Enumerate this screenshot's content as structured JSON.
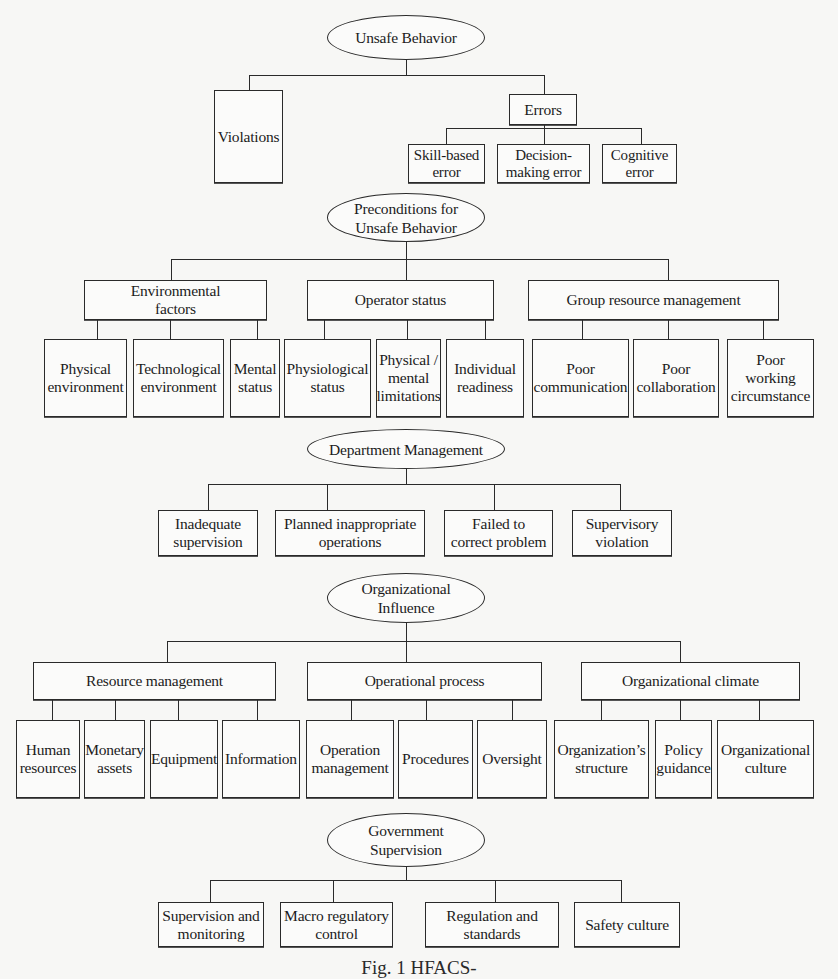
{
  "diagram": {
    "levels": [
      {
        "id": "unsafe-behavior",
        "title": "Unsafe Behavior",
        "children": [
          {
            "label": "Violations"
          },
          {
            "label": "Errors",
            "children": [
              {
                "label": "Skill-based\nerror"
              },
              {
                "label": "Decision-\nmaking error"
              },
              {
                "label": "Cognitive\nerror"
              }
            ]
          }
        ]
      },
      {
        "id": "preconditions",
        "title": "Preconditions for\nUnsafe Behavior",
        "children": [
          {
            "label": "Environmental\nfactors",
            "children": [
              {
                "label": "Physical\nenvironment"
              },
              {
                "label": "Technological\nenvironment"
              },
              {
                "label": "Mental\nstatus"
              }
            ]
          },
          {
            "label": "Operator status",
            "children": [
              {
                "label": "Physiological\nstatus"
              },
              {
                "label": "Physical /\nmental\nlimitations"
              },
              {
                "label": "Individual\nreadiness"
              }
            ]
          },
          {
            "label": "Group resource management",
            "children": [
              {
                "label": "Poor\ncommunication"
              },
              {
                "label": "Poor\ncollaboration"
              },
              {
                "label": "Poor working\ncircumstance"
              }
            ]
          }
        ]
      },
      {
        "id": "department-management",
        "title": "Department Management",
        "children": [
          {
            "label": "Inadequate\nsupervision"
          },
          {
            "label": "Planned inappropriate\noperations"
          },
          {
            "label": "Failed to\ncorrect problem"
          },
          {
            "label": "Supervisory\nviolation"
          }
        ]
      },
      {
        "id": "organizational-influence",
        "title": "Organizational\nInfluence",
        "children": [
          {
            "label": "Resource management",
            "children": [
              {
                "label": "Human\nresources"
              },
              {
                "label": "Monetary\nassets"
              },
              {
                "label": "Equipment"
              },
              {
                "label": "Information"
              }
            ]
          },
          {
            "label": "Operational process",
            "children": [
              {
                "label": "Operation\nmanagement"
              },
              {
                "label": "Procedures"
              },
              {
                "label": "Oversight"
              }
            ]
          },
          {
            "label": "Organizational climate",
            "children": [
              {
                "label": "Organization’s\nstructure"
              },
              {
                "label": "Policy\nguidance"
              },
              {
                "label": "Organizational\nculture"
              }
            ]
          }
        ]
      },
      {
        "id": "government-supervision",
        "title": "Government\nSupervision",
        "children": [
          {
            "label": "Supervision and\nmonitoring"
          },
          {
            "label": "Macro regulatory\ncontrol"
          },
          {
            "label": "Regulation and\nstandards"
          },
          {
            "label": "Safety culture"
          }
        ]
      }
    ],
    "caption": "Fig. 1  HFACS-"
  }
}
